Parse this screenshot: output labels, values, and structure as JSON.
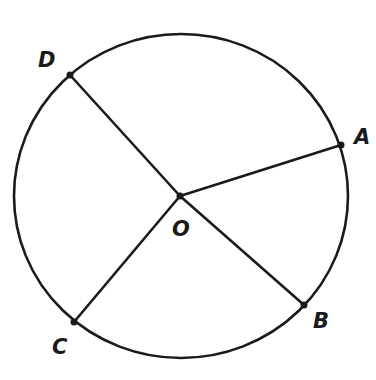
{
  "diagram": {
    "type": "circle-with-radii",
    "stroke_color": "#1a1a1a",
    "background": "#ffffff",
    "circle": {
      "cx": 181,
      "cy": 196,
      "rx": 167,
      "ry": 162
    },
    "center": {
      "label": "O",
      "x": 180,
      "y": 196,
      "label_x": 172,
      "label_y": 236
    },
    "points": [
      {
        "label": "D",
        "x": 70,
        "y": 75,
        "label_x": 38,
        "label_y": 67
      },
      {
        "label": "A",
        "x": 341,
        "y": 145,
        "label_x": 354,
        "label_y": 144
      },
      {
        "label": "B",
        "x": 304,
        "y": 305,
        "label_x": 313,
        "label_y": 328
      },
      {
        "label": "C",
        "x": 74,
        "y": 322,
        "label_x": 52,
        "label_y": 354
      }
    ],
    "segments": [
      "OD",
      "OA",
      "OB",
      "OC"
    ]
  }
}
